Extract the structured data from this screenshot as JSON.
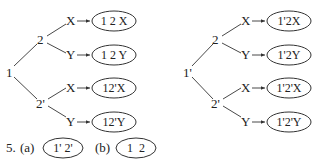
{
  "left_tree": {
    "root": "1",
    "branches": [
      {
        "node": "2",
        "leaves": [
          {
            "label": "X",
            "result": "1 2 X"
          },
          {
            "label": "Y",
            "result": "1 2 Y"
          }
        ]
      },
      {
        "node": "2'",
        "leaves": [
          {
            "label": "X",
            "result": "12'X"
          },
          {
            "label": "Y",
            "result": "12'Y"
          }
        ]
      }
    ]
  },
  "right_tree": {
    "root": "1'",
    "branches": [
      {
        "node": "2",
        "leaves": [
          {
            "label": "X",
            "result": "1'2X"
          },
          {
            "label": "Y",
            "result": "1'2Y"
          }
        ]
      },
      {
        "node": "2'",
        "leaves": [
          {
            "label": "X",
            "result": "1'2'X"
          },
          {
            "label": "Y",
            "result": "1'2'Y"
          }
        ]
      }
    ]
  },
  "answer": {
    "number": "5.",
    "part_a_label": "(a)",
    "part_a_value": "1' 2'",
    "part_b_label": "(b)",
    "part_b_value": "1  2"
  }
}
